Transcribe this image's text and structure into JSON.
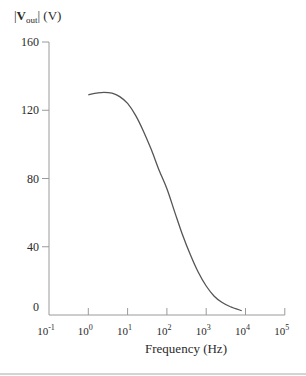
{
  "chart_data": {
    "type": "line",
    "title": "",
    "ylabel": {
      "prefix": "|",
      "main": "V",
      "sub": "out",
      "suffix": "| (V)"
    },
    "xlabel": "Frequency (Hz)",
    "xscale": "log",
    "xlim_exp": [
      -1,
      5
    ],
    "ylim": [
      0,
      160
    ],
    "yticks": [
      0,
      40,
      80,
      120,
      160
    ],
    "xticks": [
      {
        "base": "10",
        "exp": "-1"
      },
      {
        "base": "10",
        "exp": "0"
      },
      {
        "base": "10",
        "exp": "1"
      },
      {
        "base": "10",
        "exp": "2"
      },
      {
        "base": "10",
        "exp": "3"
      },
      {
        "base": "10",
        "exp": "4"
      },
      {
        "base": "10",
        "exp": "5"
      }
    ],
    "grid": false,
    "legend": null,
    "series": [
      {
        "name": "|Vout|",
        "color": "#555555",
        "points": [
          {
            "f": 1,
            "v": 129
          },
          {
            "f": 1.6,
            "v": 130
          },
          {
            "f": 2.5,
            "v": 130.5
          },
          {
            "f": 4,
            "v": 130
          },
          {
            "f": 6.3,
            "v": 128
          },
          {
            "f": 10,
            "v": 124
          },
          {
            "f": 16,
            "v": 117
          },
          {
            "f": 25,
            "v": 108
          },
          {
            "f": 40,
            "v": 97
          },
          {
            "f": 63,
            "v": 85
          },
          {
            "f": 100,
            "v": 74
          },
          {
            "f": 160,
            "v": 60
          },
          {
            "f": 250,
            "v": 47
          },
          {
            "f": 400,
            "v": 35
          },
          {
            "f": 630,
            "v": 25
          },
          {
            "f": 1000,
            "v": 17
          },
          {
            "f": 1600,
            "v": 11
          },
          {
            "f": 2500,
            "v": 7.5
          },
          {
            "f": 4000,
            "v": 5
          },
          {
            "f": 8000,
            "v": 2.5
          }
        ]
      }
    ]
  }
}
